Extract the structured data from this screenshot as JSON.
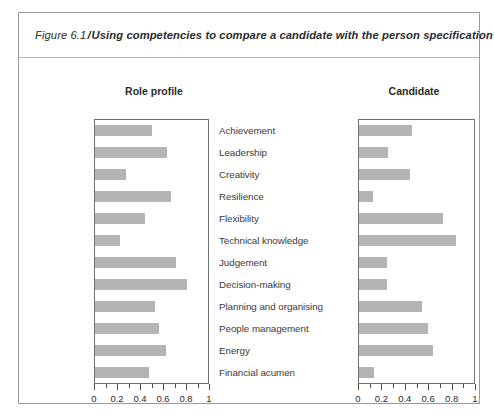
{
  "figure": {
    "number": "Figure 6.1",
    "separator": "/",
    "title": "Using competencies to compare a candidate with the person specification"
  },
  "panels": {
    "left_heading": "Role profile",
    "right_heading": "Candidate"
  },
  "axis": {
    "tick_labels": [
      "0",
      "0.2",
      "0.4",
      "0.6",
      "0.8",
      "1"
    ],
    "tick_values": [
      0,
      0.2,
      0.4,
      0.6,
      0.8,
      1
    ]
  },
  "colors": {
    "bar": "#b4b4b4",
    "frame": "#9a9a9a",
    "plot_border": "#6f6f6f",
    "text": "#3a3a3a"
  },
  "chart_data": {
    "type": "bar",
    "orientation": "horizontal",
    "title": "Using competencies to compare a candidate with the person specification",
    "xlabel": "",
    "ylabel": "",
    "xlim": [
      0,
      1
    ],
    "grid": false,
    "legend": "none",
    "panels": [
      "Role profile",
      "Candidate"
    ],
    "categories": [
      "Achievement",
      "Leadership",
      "Creativity",
      "Resilience",
      "Flexibility",
      "Technical knowledge",
      "Judgement",
      "Decision-making",
      "Planning and organising",
      "People management",
      "Energy",
      "Financial acumen"
    ],
    "series": [
      {
        "name": "Role profile",
        "values": [
          0.5,
          0.64,
          0.27,
          0.67,
          0.44,
          0.22,
          0.72,
          0.81,
          0.53,
          0.57,
          0.63,
          0.48
        ]
      },
      {
        "name": "Candidate",
        "values": [
          0.46,
          0.25,
          0.44,
          0.12,
          0.73,
          0.84,
          0.24,
          0.24,
          0.55,
          0.6,
          0.64,
          0.13
        ]
      }
    ],
    "tick_labels": [
      "0",
      "0.2",
      "0.4",
      "0.6",
      "0.8",
      "1"
    ]
  }
}
